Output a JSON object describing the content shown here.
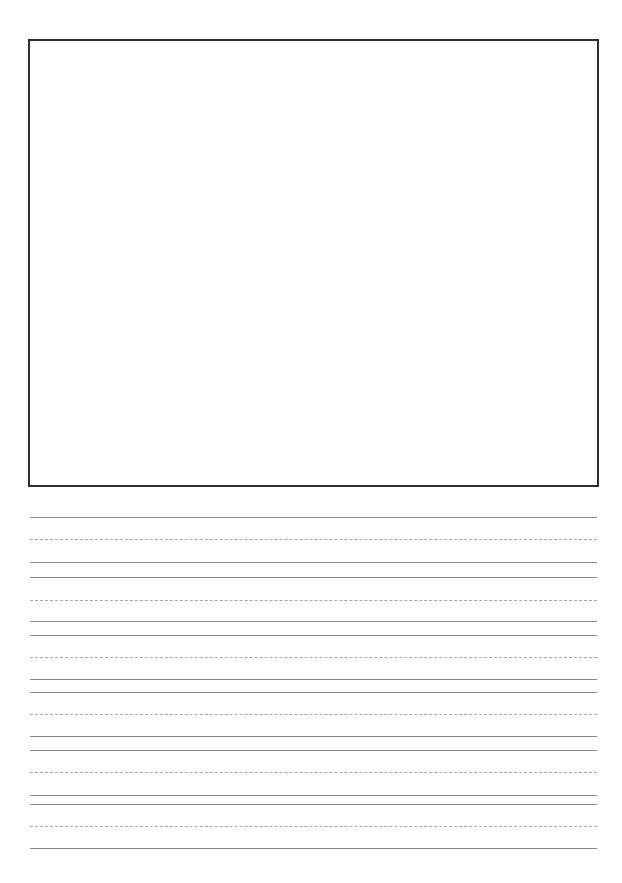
{
  "page": {
    "type": "handwriting-practice-sheet",
    "background_color": "#ffffff"
  },
  "drawing_box": {
    "border_color": "#2e2e2e",
    "left": 28,
    "top": 39,
    "width": 567,
    "height": 444
  },
  "writing_rows": [
    {
      "lines": [
        {
          "y": 517,
          "style": "solid"
        },
        {
          "y": 539,
          "style": "dashed"
        },
        {
          "y": 562,
          "style": "solid"
        }
      ]
    },
    {
      "lines": [
        {
          "y": 577,
          "style": "solid"
        },
        {
          "y": 600,
          "style": "dashed"
        },
        {
          "y": 621,
          "style": "solid"
        }
      ]
    },
    {
      "lines": [
        {
          "y": 635,
          "style": "solid"
        },
        {
          "y": 657,
          "style": "dashed"
        },
        {
          "y": 679,
          "style": "solid"
        }
      ]
    },
    {
      "lines": [
        {
          "y": 692,
          "style": "solid"
        },
        {
          "y": 714,
          "style": "dashed"
        },
        {
          "y": 736,
          "style": "solid"
        }
      ]
    },
    {
      "lines": [
        {
          "y": 750,
          "style": "solid"
        },
        {
          "y": 772,
          "style": "dashed"
        },
        {
          "y": 795,
          "style": "solid"
        }
      ]
    },
    {
      "lines": [
        {
          "y": 804,
          "style": "solid"
        },
        {
          "y": 826,
          "style": "dashed"
        },
        {
          "y": 848,
          "style": "solid"
        }
      ]
    }
  ],
  "line_colors": {
    "solid": "#8a8a8a",
    "dashed": "#a8a8a8"
  }
}
